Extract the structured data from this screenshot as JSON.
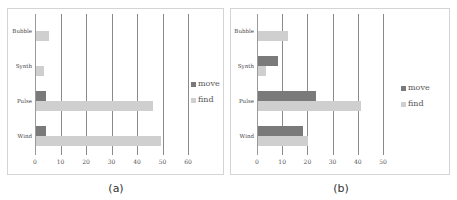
{
  "colors": {
    "move": "#7a7a7a",
    "find": "#cfcfcf"
  },
  "chart_data": [
    {
      "type": "bar",
      "orientation": "horizontal",
      "caption": "(a)",
      "categories": [
        "Wind",
        "Pulse",
        "Synth",
        "Bubble"
      ],
      "series": [
        {
          "name": "move",
          "values": [
            4,
            4,
            0,
            0
          ]
        },
        {
          "name": "find",
          "values": [
            49,
            46,
            3,
            5
          ]
        }
      ],
      "xlim": [
        0,
        60
      ],
      "xticks": [
        "0",
        "10",
        "20",
        "30",
        "40",
        "50",
        "60"
      ],
      "grid": true,
      "legend_position": "right"
    },
    {
      "type": "bar",
      "orientation": "horizontal",
      "caption": "(b)",
      "categories": [
        "Wind",
        "Pulse",
        "Synth",
        "Bubble"
      ],
      "series": [
        {
          "name": "move",
          "values": [
            18,
            23,
            8,
            0
          ]
        },
        {
          "name": "find",
          "values": [
            20,
            41,
            3,
            12
          ]
        }
      ],
      "xlim": [
        0,
        50
      ],
      "xticks": [
        "0",
        "10",
        "20",
        "30",
        "40",
        "50"
      ],
      "grid": true,
      "legend_position": "right"
    }
  ]
}
